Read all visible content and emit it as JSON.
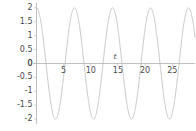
{
  "chart_data": {
    "type": "line",
    "title": "",
    "xlabel": "t",
    "ylabel": "",
    "xlim": [
      -0.6,
      29.2
    ],
    "ylim": [
      -2.18,
      2.18
    ],
    "grid": false,
    "legend": null,
    "series": [
      {
        "name": "x(t)",
        "description": "cosine wave, amplitude 2, period approximately 7, peak at t=0",
        "amplitude": 2,
        "period": 7,
        "phase_deg": 0,
        "color": "#b9b9b9",
        "linewidth": 0.8,
        "x": [
          0,
          0.875,
          1.75,
          2.625,
          3.5,
          4.375,
          5.25,
          6.125,
          7,
          7.875,
          8.75,
          9.625,
          10.5,
          11.375,
          12.25,
          13.125,
          14,
          14.875,
          15.75,
          16.625,
          17.5,
          18.375,
          19.25,
          20.125,
          21,
          21.875,
          22.75,
          23.625,
          24.5,
          25.375,
          26.25,
          27.125,
          28,
          28.875
        ],
        "y": [
          2,
          1.414,
          0,
          -1.414,
          -2,
          -1.414,
          0,
          1.414,
          2,
          1.414,
          0,
          -1.414,
          -2,
          -1.414,
          0,
          1.414,
          2,
          1.414,
          0,
          -1.414,
          -2,
          -1.414,
          0,
          1.414,
          2,
          1.414,
          0,
          -1.414,
          -2,
          -1.414,
          0,
          1.414,
          2,
          1.414
        ]
      }
    ],
    "y_ticks": [
      {
        "value": 2,
        "label": "2"
      },
      {
        "value": 1.5,
        "label": "1.5"
      },
      {
        "value": 1,
        "label": "1"
      },
      {
        "value": 0.5,
        "label": "0.5"
      },
      {
        "value": 0,
        "label": "0"
      },
      {
        "value": -0.5,
        "label": "-0.5"
      },
      {
        "value": -1,
        "label": "-1"
      },
      {
        "value": -1.5,
        "label": "-1.5"
      },
      {
        "value": -2,
        "label": "-2"
      }
    ],
    "x_ticks": [
      {
        "value": 5,
        "label": "5"
      },
      {
        "value": 10,
        "label": "10"
      },
      {
        "value": 15,
        "label": "15"
      },
      {
        "value": 20,
        "label": "20"
      },
      {
        "value": 25,
        "label": "25"
      }
    ],
    "axis_color": "#b0b0b0",
    "tick_color": "#c4c4c4",
    "text_color": "#4a4a4a",
    "background": "#ffffff"
  }
}
